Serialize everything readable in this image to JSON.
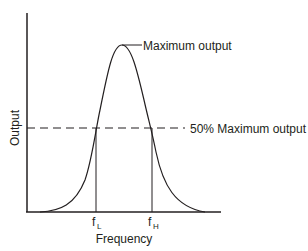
{
  "diagram": {
    "title": "",
    "y_axis_label": "Output",
    "x_axis_label": "Frequency",
    "peak_label": "Maximum output",
    "half_power_label": "50% Maximum output",
    "f_low": {
      "base": "f",
      "sub": "L"
    },
    "f_high": {
      "base": "f",
      "sub": "H"
    },
    "colors": {
      "line": "#231f20",
      "background": "#ffffff"
    }
  }
}
